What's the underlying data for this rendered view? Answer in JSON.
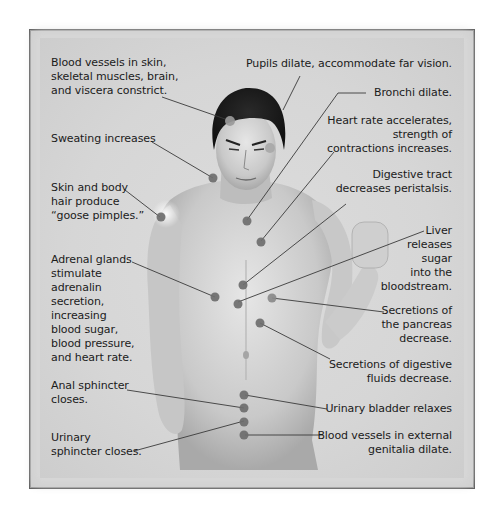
{
  "figure": {
    "colors": {
      "panel": "#d4d4d4",
      "border": "#5c5c5c",
      "dot": "#6e6e6e",
      "line": "#3a3a3a",
      "text": "#1b1b1b"
    },
    "labels_left": [
      {
        "id": "blood-vessels-constrict",
        "text": "Blood vessels in skin,\nskeletal muscles, brain,\nand viscera constrict."
      },
      {
        "id": "sweating",
        "text": "Sweating increases"
      },
      {
        "id": "goose-pimples",
        "text": "Skin and body\nhair produce\n“goose pimples.”"
      },
      {
        "id": "adrenal",
        "text": "Adrenal glands\nstimulate\nadrenalin\nsecretion,\nincreasing\nblood sugar,\nblood pressure,\nand heart rate."
      },
      {
        "id": "anal-sphincter",
        "text": "Anal sphincter\ncloses."
      },
      {
        "id": "urinary-sphincter",
        "text": "Urinary\nsphincter closes."
      }
    ],
    "labels_right": [
      {
        "id": "pupils",
        "text": "Pupils dilate, accommodate far vision."
      },
      {
        "id": "bronchi",
        "text": "Bronchi dilate."
      },
      {
        "id": "heart-rate",
        "text": "Heart rate accelerates,\nstrength of\ncontractions increases."
      },
      {
        "id": "digestive-tract",
        "text": "Digestive tract\ndecreases peristalsis."
      },
      {
        "id": "liver",
        "text": "Liver\nreleases\nsugar\ninto the\nbloodstream."
      },
      {
        "id": "pancreas",
        "text": "Secretions of\nthe pancreas\ndecrease."
      },
      {
        "id": "digestive-fluids",
        "text": "Secretions of digestive\nfluids decrease."
      },
      {
        "id": "urinary-bladder",
        "text": "Urinary bladder relaxes"
      },
      {
        "id": "genitalia",
        "text": "Blood vessels in external\ngenitalia dilate."
      }
    ]
  }
}
